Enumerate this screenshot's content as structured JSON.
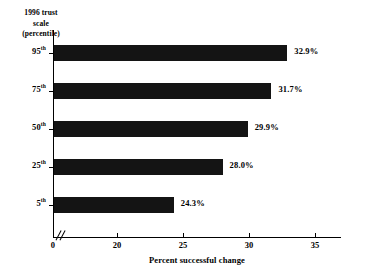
{
  "chart_data": {
    "type": "bar",
    "orientation": "horizontal",
    "title": "",
    "xlabel": "Percent successful change",
    "ylabel": "1996 trust scale (percentile)",
    "ylabel_lines": [
      "1996 trust",
      "scale",
      "(percentile)"
    ],
    "categories": [
      "95th",
      "75th",
      "50th",
      "25th",
      "5th"
    ],
    "category_bases": [
      "95",
      "75",
      "50",
      "25",
      "5"
    ],
    "category_suffix": "th",
    "values": [
      32.9,
      31.7,
      29.9,
      28.0,
      24.3
    ],
    "value_labels": [
      "32.9%",
      "31.7%",
      "29.9%",
      "28.0%",
      "24.3%"
    ],
    "xlim": [
      20,
      35.4
    ],
    "axis_break": true,
    "axis_break_at": 0,
    "xticks": [
      0,
      20,
      25,
      30,
      35
    ],
    "xtick_labels": [
      "0",
      "20",
      "25",
      "30",
      "35"
    ],
    "grid": false,
    "legend": "none",
    "bar_color": "#141414",
    "axis_color": "#000000",
    "background": "#ffffff"
  }
}
